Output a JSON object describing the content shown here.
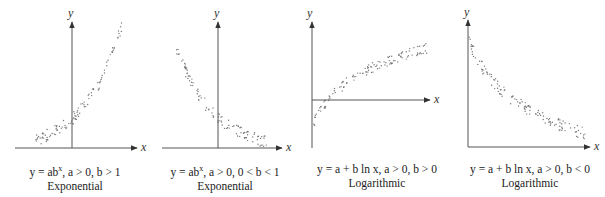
{
  "chart_data": [
    {
      "type": "scatter",
      "title": "Exponential",
      "equation": "y = ab^x, a > 0, b > 1",
      "xlabel": "x",
      "ylabel": "y",
      "trend": "increasing, convex (exponential growth)",
      "grid": false
    },
    {
      "type": "scatter",
      "title": "Exponential",
      "equation": "y = ab^x, a > 0, 0 < b < 1",
      "xlabel": "x",
      "ylabel": "y",
      "trend": "decreasing, convex (exponential decay)",
      "grid": false
    },
    {
      "type": "scatter",
      "title": "Logarithmic",
      "equation": "y = a + b ln x, a > 0, b > 0",
      "xlabel": "x",
      "ylabel": "y",
      "trend": "increasing, concave (logarithmic growth)",
      "grid": false
    },
    {
      "type": "scatter",
      "title": "Logarithmic",
      "equation": "y = a + b ln x, a > 0, b < 0",
      "xlabel": "x",
      "ylabel": "y",
      "trend": "decreasing, convex (logarithmic decay)",
      "grid": false
    }
  ],
  "panels": [
    {
      "eq_pre": "y = ab",
      "eq_sup": "x",
      "eq_post": ", a > 0, b > 1",
      "name": "Exponential"
    },
    {
      "eq_pre": "y = ab",
      "eq_sup": "x",
      "eq_post": ", a > 0, 0 < b < 1",
      "name": "Exponential"
    },
    {
      "eq_pre": "y = a + b ln x, a > 0, b > 0",
      "eq_sup": "",
      "eq_post": "",
      "name": "Logarithmic"
    },
    {
      "eq_pre": "y = a + b ln x, a > 0, b < 0",
      "eq_sup": "",
      "eq_post": "",
      "name": "Logarithmic"
    }
  ],
  "axes": {
    "x": "x",
    "y": "y"
  },
  "colors": {
    "axis": "#444444",
    "dots": "#777777"
  }
}
